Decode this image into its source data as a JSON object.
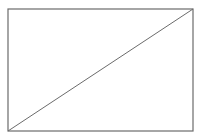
{
  "diagram": {
    "shape": "rectangle-with-diagonal",
    "stroke_color": "#6b6b6b",
    "background": "#ffffff",
    "rect": {
      "x": 8,
      "y": 9,
      "width": 185,
      "height": 122
    },
    "diagonal": {
      "x1": 8,
      "y1": 131,
      "x2": 193,
      "y2": 9
    }
  }
}
